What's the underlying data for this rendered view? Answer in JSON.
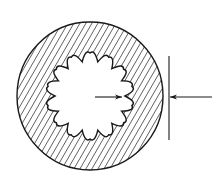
{
  "document": {
    "title": "Splined Bore Cross-Section",
    "type": "engineering-cross-section-drawing",
    "background_color": "#ffffff",
    "canvas": {
      "width": 212,
      "height": 185
    }
  },
  "drawing": {
    "line_color": "#1a1a1a",
    "hatch_color": "#2b2b2b",
    "fill_color": "#ffffff",
    "outer_circle": {
      "name": "outer-boundary-circle",
      "center_x": 90,
      "center_y": 96,
      "radius_x": 73,
      "radius_y": 74,
      "stroke_width": 1.4
    },
    "inner_splined_bore": {
      "name": "splined-bore-profile",
      "center_x": 90,
      "center_y": 96,
      "lobe_count": 14,
      "outer_radius": 43,
      "inner_radius": 35,
      "stroke_width": 1.4
    },
    "section_hatching": {
      "name": "section-hatch-pattern",
      "angle_degrees": 60,
      "spacing": 5.2,
      "stroke_width": 0.75
    },
    "annotations": {
      "extension_line": {
        "name": "vertical-extension-line",
        "x": 169,
        "y_top": 56,
        "y_bottom": 140,
        "stroke_width": 1.1
      },
      "exterior_leader_arrow": {
        "name": "exterior-dimension-arrow",
        "x_start": 212,
        "x_end": 170,
        "y": 97,
        "direction": "left",
        "stroke_width": 1.1
      },
      "interior_leader_arrow": {
        "name": "interior-dimension-arrow",
        "x_start": 95,
        "x_end": 122,
        "y": 97,
        "direction": "right",
        "stroke_width": 1.1
      }
    }
  }
}
